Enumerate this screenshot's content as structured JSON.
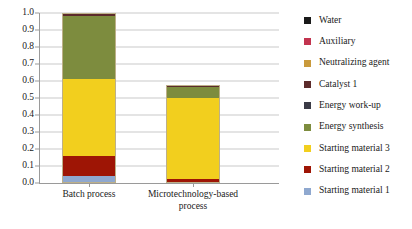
{
  "chart_data": {
    "type": "bar",
    "subtype": "stacked-bar",
    "title": "",
    "xlabel": "",
    "ylabel": "",
    "ylim": [
      0.0,
      1.0
    ],
    "grid": true,
    "legend_position": "right",
    "categories": [
      "Batch process",
      "Microtechnology-based process"
    ],
    "ytick_labels": [
      "1.0",
      "0.9",
      "0.8",
      "0.7",
      "0.6",
      "0.5",
      "0.4",
      "0.3",
      "0.2",
      "0.1",
      "0.0"
    ],
    "ytick_values": [
      1.0,
      0.9,
      0.8,
      0.7,
      0.6,
      0.5,
      0.4,
      0.3,
      0.2,
      0.1,
      0.0
    ],
    "series": [
      {
        "name": "Water",
        "color": "#1a1a1a",
        "values": [
          0.0,
          0.0
        ]
      },
      {
        "name": "Auxiliary",
        "color": "#c2344f",
        "values": [
          0.0,
          0.0
        ]
      },
      {
        "name": "Neutralizing agent",
        "color": "#c99a3c",
        "values": [
          0.0,
          0.0
        ]
      },
      {
        "name": "Catalyst 1",
        "color": "#5c2b2b",
        "values": [
          0.015,
          0.01
        ]
      },
      {
        "name": "Energy work-up",
        "color": "#3b3b46",
        "values": [
          0.0,
          0.0
        ]
      },
      {
        "name": "Energy synthesis",
        "color": "#7d8c3e",
        "values": [
          0.375,
          0.065
        ]
      },
      {
        "name": "Starting material 3",
        "color": "#f2cf1e",
        "values": [
          0.45,
          0.475
        ]
      },
      {
        "name": "Starting material 2",
        "color": "#9e1505",
        "values": [
          0.12,
          0.025
        ]
      },
      {
        "name": "Starting material 1",
        "color": "#8fa8cf",
        "values": [
          0.04,
          0.0
        ]
      }
    ],
    "totals": [
      1.0,
      0.575
    ]
  },
  "legend": {
    "items": [
      {
        "label": "Water",
        "color": "#1a1a1a"
      },
      {
        "label": "Auxiliary",
        "color": "#c2344f"
      },
      {
        "label": "Neutralizing agent",
        "color": "#c99a3c"
      },
      {
        "label": "Catalyst 1",
        "color": "#5c2b2b"
      },
      {
        "label": "Energy work-up",
        "color": "#3b3b46"
      },
      {
        "label": "Energy synthesis",
        "color": "#7d8c3e"
      },
      {
        "label": "Starting material 3",
        "color": "#f2cf1e"
      },
      {
        "label": "Starting material 2",
        "color": "#9e1505"
      },
      {
        "label": "Starting material 1",
        "color": "#8fa8cf"
      }
    ]
  },
  "axis": {
    "y_labels": [
      "1.0",
      "0.9",
      "0.8",
      "0.7",
      "0.6",
      "0.5",
      "0.4",
      "0.3",
      "0.2",
      "0.1",
      "0.0"
    ]
  },
  "bars": [
    {
      "category": "Batch process",
      "label_line1": "Batch process",
      "label_line2": "",
      "stack": [
        {
          "name": "Starting material 1",
          "color": "#8fa8cf",
          "start": 0.0,
          "end": 0.04
        },
        {
          "name": "Starting material 2",
          "color": "#9e1505",
          "start": 0.04,
          "end": 0.16
        },
        {
          "name": "Starting material 3",
          "color": "#f2cf1e",
          "start": 0.16,
          "end": 0.61
        },
        {
          "name": "Energy synthesis",
          "color": "#7d8c3e",
          "start": 0.61,
          "end": 0.985
        },
        {
          "name": "Catalyst 1",
          "color": "#5c2b2b",
          "start": 0.985,
          "end": 1.0
        }
      ]
    },
    {
      "category": "Microtechnology-based process",
      "label_line1": "Microtechnology-based",
      "label_line2": "process",
      "stack": [
        {
          "name": "Starting material 2",
          "color": "#9e1505",
          "start": 0.0,
          "end": 0.025
        },
        {
          "name": "Starting material 3",
          "color": "#f2cf1e",
          "start": 0.025,
          "end": 0.5
        },
        {
          "name": "Energy synthesis",
          "color": "#7d8c3e",
          "start": 0.5,
          "end": 0.565
        },
        {
          "name": "Catalyst 1",
          "color": "#5c2b2b",
          "start": 0.565,
          "end": 0.575
        }
      ]
    }
  ]
}
